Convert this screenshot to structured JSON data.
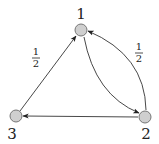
{
  "diagram": {
    "type": "directed-graph",
    "nodes": [
      {
        "id": "1",
        "label": "1",
        "x": 81,
        "y": 30
      },
      {
        "id": "2",
        "label": "2",
        "x": 145,
        "y": 117
      },
      {
        "id": "3",
        "label": "3",
        "x": 16,
        "y": 116
      }
    ],
    "edges": [
      {
        "from": "3",
        "to": "1",
        "label": {
          "numerator": "1",
          "denominator": "2"
        }
      },
      {
        "from": "1",
        "to": "2",
        "label": null
      },
      {
        "from": "2",
        "to": "1",
        "label": {
          "numerator": "1",
          "denominator": "2"
        }
      },
      {
        "from": "2",
        "to": "3",
        "label": null
      }
    ],
    "colors": {
      "node_fill": "#cfcfcf",
      "node_stroke": "#777777",
      "edge": "#333333",
      "text": "#222222"
    }
  }
}
